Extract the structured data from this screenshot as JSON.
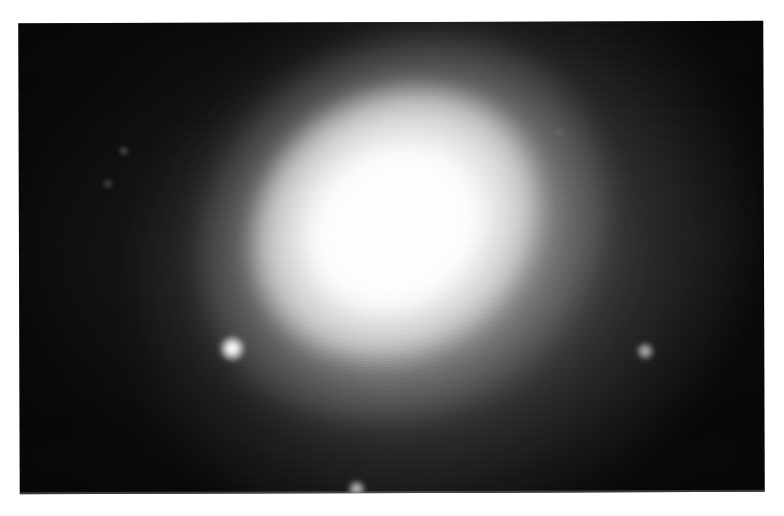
{
  "page": {
    "background_color": "#ffffff",
    "width": 784,
    "height": 516,
    "caption": ""
  },
  "plate": {
    "name": "photographic-plate",
    "description": "Scanned black-and-white astronomical photograph of an elliptical galaxy",
    "x": 19,
    "y": 22,
    "width": 745,
    "height": 471,
    "sky_color": "#040404",
    "border_color": "#ffffff",
    "rotation_deg": -0.18,
    "texture": "halftone-dither-grain"
  },
  "galaxy": {
    "name": "elliptical-galaxy",
    "morphology": "elliptical",
    "center_x": 386,
    "center_y": 229,
    "core_color": "#ffffff",
    "halo_color": "#9a9a9a",
    "position_angle_deg": -34,
    "layers": [
      {
        "label": "outer-halo",
        "semi_major": 320,
        "semi_minor": 270,
        "peak_opacity": 0.62
      },
      {
        "label": "mid-halo",
        "semi_major": 215,
        "semi_minor": 184,
        "peak_opacity": 0.92
      },
      {
        "label": "inner-body",
        "semi_major": 149,
        "semi_minor": 128,
        "peak_opacity": 1.0
      },
      {
        "label": "saturated-core",
        "semi_major": 88,
        "semi_minor": 75,
        "peak_opacity": 1.0
      }
    ]
  },
  "stars": [
    {
      "label": "field-star-bright-left",
      "x": 232,
      "y": 348,
      "radius": 13,
      "brightness": 1.0
    },
    {
      "label": "field-star-right",
      "x": 645,
      "y": 352,
      "radius": 9,
      "brightness": 0.62
    },
    {
      "label": "field-star-bottom",
      "x": 356,
      "y": 489,
      "radius": 9,
      "brightness": 0.7
    },
    {
      "label": "field-star-faint-upper-left",
      "x": 124,
      "y": 150,
      "radius": 4,
      "brightness": 0.4
    },
    {
      "label": "field-star-faint-left",
      "x": 108,
      "y": 183,
      "radius": 4,
      "brightness": 0.36
    },
    {
      "label": "field-star-faint-upper-right",
      "x": 560,
      "y": 132,
      "radius": 3,
      "brightness": 0.26
    },
    {
      "label": "field-star-faint-mid-left",
      "x": 300,
      "y": 300,
      "radius": 3,
      "brightness": 0.22
    }
  ],
  "colors": {
    "paper": "#ffffff",
    "sky": "#040404",
    "star": "#ffffff",
    "core": "#ffffff"
  }
}
